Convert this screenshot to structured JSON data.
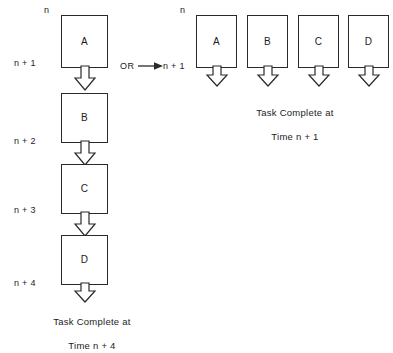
{
  "diagram": {
    "background_color": "#ffffff",
    "stroke_color": "#2a2a2a",
    "connector": "down-block-arrow",
    "or_label": "OR",
    "or_arrow_icon": "arrow-right-icon"
  },
  "sequential": {
    "name": "sequential-column",
    "time_labels": [
      {
        "text": "n"
      },
      {
        "text": "n + 1"
      },
      {
        "text": "n + 2"
      },
      {
        "text": "n + 3"
      },
      {
        "text": "n + 4"
      }
    ],
    "tasks": [
      {
        "letter": "A"
      },
      {
        "letter": "B"
      },
      {
        "letter": "C"
      },
      {
        "letter": "D"
      }
    ],
    "caption_line1": "Task Complete at",
    "caption_line2": "Time n + 4"
  },
  "parallel": {
    "name": "parallel-row",
    "time_labels": [
      {
        "text": "n"
      },
      {
        "text": "n + 1"
      }
    ],
    "tasks": [
      {
        "letter": "A"
      },
      {
        "letter": "B"
      },
      {
        "letter": "C"
      },
      {
        "letter": "D"
      }
    ],
    "caption_line1": "Task Complete at",
    "caption_line2": "Time n + 1"
  }
}
